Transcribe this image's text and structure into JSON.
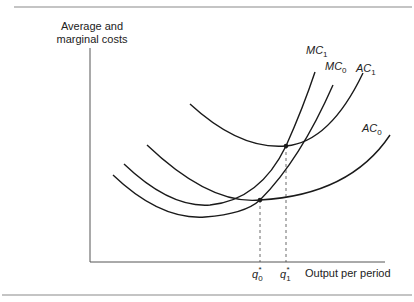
{
  "figure": {
    "y_axis_label_line1": "Average and",
    "y_axis_label_line2": "marginal costs",
    "x_axis_label": "Output per period",
    "q0_label": {
      "base": "q",
      "sub": "0",
      "sup": "*"
    },
    "q1_label": {
      "base": "q",
      "sub": "1",
      "sup": "*"
    },
    "curves": [
      {
        "id": "MC1",
        "base": "MC",
        "sub": "1"
      },
      {
        "id": "MC0",
        "base": "MC",
        "sub": "0"
      },
      {
        "id": "AC1",
        "base": "AC",
        "sub": "1"
      },
      {
        "id": "AC0",
        "base": "AC",
        "sub": "0"
      }
    ]
  }
}
